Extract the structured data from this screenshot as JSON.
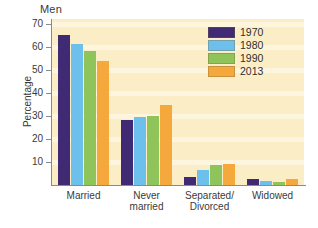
{
  "chart_data": {
    "type": "bar",
    "title": "Men",
    "xlabel": "",
    "ylabel": "Percentage",
    "ylim": [
      0,
      72
    ],
    "yticks": [
      10,
      20,
      30,
      40,
      50,
      60,
      70
    ],
    "grid": true,
    "legend_position": "top-right",
    "categories": [
      "Married",
      "Never\nmarried",
      "Separated/\nDivorced",
      "Widowed"
    ],
    "series": [
      {
        "name": "1970",
        "color": "#3f2a73",
        "values": [
          65,
          28,
          3.5,
          2.5
        ]
      },
      {
        "name": "1980",
        "color": "#6dc0ec",
        "values": [
          61,
          29.5,
          6.5,
          1.8
        ]
      },
      {
        "name": "1990",
        "color": "#8ec45a",
        "values": [
          58,
          30,
          8.8,
          1.5
        ]
      },
      {
        "name": "2013",
        "color": "#f5a93c",
        "values": [
          54,
          34.5,
          9.3,
          2.5
        ]
      }
    ]
  },
  "axis": {
    "tick_labels": [
      "70",
      "60",
      "50",
      "40",
      "30",
      "20",
      "10"
    ],
    "y_title": "Percentage"
  },
  "legend": {
    "entries": [
      {
        "label": "1970",
        "color": "#3f2a73"
      },
      {
        "label": "1980",
        "color": "#6dc0ec"
      },
      {
        "label": "1990",
        "color": "#8ec45a"
      },
      {
        "label": "2013",
        "color": "#f5a93c"
      }
    ]
  },
  "categories_display": [
    "Married",
    "Never\nmarried",
    "Separated/\nDivorced",
    "Widowed"
  ],
  "colors": {
    "plot_background": "#fbeec6",
    "page_background": "#ffffff",
    "axis": "#8a8a8a",
    "text": "#3a3a3a"
  }
}
